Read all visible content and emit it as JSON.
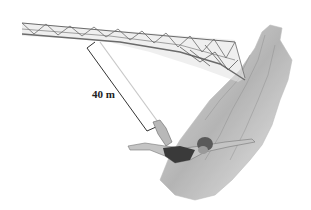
{
  "figure": {
    "dimension_label": "40 m",
    "colors": {
      "background": "#ffffff",
      "bridge": "#6b6b6b",
      "cliff": "#9a9a9a",
      "cord": "#c8c8c8",
      "dimension_line": "#333333",
      "jumper_suit": "#3a3a3a",
      "skin": "#b5b5b5"
    }
  }
}
